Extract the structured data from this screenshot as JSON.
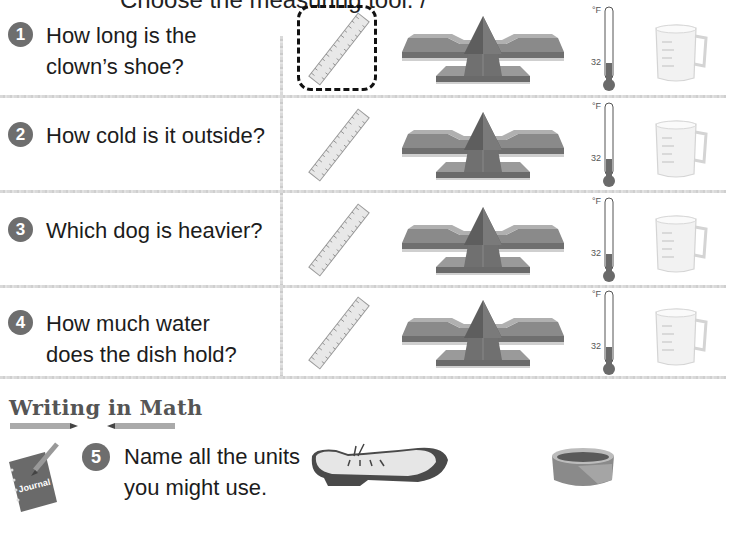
{
  "page": {
    "clipped_header_fragment": "Choose the measuring tool. /",
    "theme_colors": {
      "number_badge": "#6e6e6e",
      "text": "#1c1c1c",
      "divider": "#d6d6d6",
      "selection_border": "#111111",
      "thermometer_fill": "#6a6a6a"
    }
  },
  "rows": [
    {
      "number": "1",
      "question_line1": "How long is the",
      "question_line2": "clown’s shoe?",
      "selected_tool": "ruler"
    },
    {
      "number": "2",
      "question_line1": "How cold is it outside?",
      "question_line2": ""
    },
    {
      "number": "3",
      "question_line1": "Which dog is heavier?",
      "question_line2": ""
    },
    {
      "number": "4",
      "question_line1": "How much water",
      "question_line2": "does the dish hold?"
    }
  ],
  "tools": {
    "ruler": "ruler-icon",
    "balance": "balance-scale-icon",
    "thermometer": "thermometer-icon",
    "thermometer_unit": "°F",
    "thermometer_mark": "32",
    "measuring_cup": "measuring-cup-icon"
  },
  "writing_in_math": {
    "heading": "Writing in Math",
    "journal_label": "Journal",
    "number": "5",
    "question_line1": "Name all the units",
    "question_line2": "you might use.",
    "images": [
      "clown-shoe",
      "dog-bowl"
    ]
  }
}
